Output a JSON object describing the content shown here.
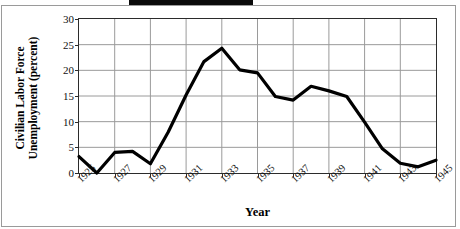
{
  "figure": {
    "top_bar_present": true,
    "top_bar_color": "#0a0a0a",
    "frame_color": "#9a9a9a",
    "line_color": "#000000",
    "grid_color": "#9a9a9a"
  },
  "chart_data": {
    "type": "line",
    "title": "",
    "xlabel": "Year",
    "ylabel": "Civilian Labor Force Unemployment (percent)",
    "ylabel_line1": "Civilian Labor Force",
    "ylabel_line2": "Unemployment (percent)",
    "x": [
      1925,
      1926,
      1927,
      1928,
      1929,
      1930,
      1931,
      1932,
      1933,
      1934,
      1935,
      1936,
      1937,
      1938,
      1939,
      1940,
      1941,
      1942,
      1943,
      1944,
      1945
    ],
    "values": [
      3.2,
      0.0,
      4.0,
      4.2,
      1.8,
      8.0,
      15.2,
      21.7,
      24.3,
      20.1,
      19.5,
      14.9,
      14.2,
      16.9,
      16.0,
      14.9,
      9.9,
      4.7,
      1.9,
      1.2,
      2.5
    ],
    "yticks": [
      0,
      5,
      10,
      15,
      20,
      25,
      30
    ],
    "ytick_labels": [
      "0",
      "5",
      "10",
      "15",
      "20",
      "25",
      "30"
    ],
    "ylim": [
      0,
      30
    ],
    "xlim": [
      1925,
      1945
    ],
    "xticks": [
      1925,
      1927,
      1929,
      1931,
      1933,
      1935,
      1937,
      1939,
      1941,
      1943,
      1945
    ],
    "xtick_labels": [
      "1925",
      "1927",
      "1929",
      "1931",
      "1933",
      "1935",
      "1937",
      "1939",
      "1941",
      "1943",
      "1945"
    ],
    "grid": true,
    "legend": null,
    "series_name": "Civilian Labor Force Unemployment"
  }
}
